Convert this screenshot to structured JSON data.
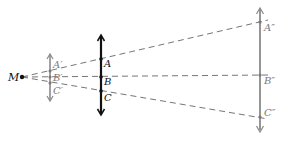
{
  "diagram": {
    "type": "projection-of-arrows",
    "origin": {
      "label": "M",
      "x": 22,
      "y": 77
    },
    "colors": {
      "black": "#111111",
      "gray": "#8a8a8a",
      "dashed": "#666666",
      "label_gray": "#7a7a7a"
    },
    "arrows": [
      {
        "id": "small",
        "color": "gray",
        "x": 50,
        "y_top": 54,
        "y_bottom": 101,
        "points": [
          {
            "label": "A′",
            "y": 71
          },
          {
            "label": "B′",
            "y": 77
          },
          {
            "label": "C′",
            "y": 83
          }
        ]
      },
      {
        "id": "middle",
        "color": "black",
        "x": 101,
        "y_top": 35,
        "y_bottom": 115,
        "points": [
          {
            "label": "A",
            "y": 59
          },
          {
            "label": "B",
            "y": 77
          },
          {
            "label": "C",
            "y": 91
          }
        ]
      },
      {
        "id": "large",
        "color": "gray",
        "x": 260,
        "y_top": 8,
        "y_bottom": 131,
        "points": [
          {
            "label": "A″",
            "y": 22
          },
          {
            "label": "B″",
            "y": 75
          },
          {
            "label": "C″",
            "y": 117
          }
        ]
      }
    ],
    "rays": [
      {
        "from": "M",
        "to": "A″",
        "end_x": 268,
        "end_y": 20
      },
      {
        "from": "M",
        "to": "B″",
        "end_x": 268,
        "end_y": 75
      },
      {
        "from": "M",
        "to": "C″",
        "end_x": 268,
        "end_y": 119
      }
    ]
  },
  "labels": {
    "M": "M",
    "A1": "A′",
    "B1": "B′",
    "C1": "C′",
    "A": "A",
    "B": "B",
    "C": "C",
    "A2": "A″",
    "B2": "B″",
    "C2": "C″"
  }
}
